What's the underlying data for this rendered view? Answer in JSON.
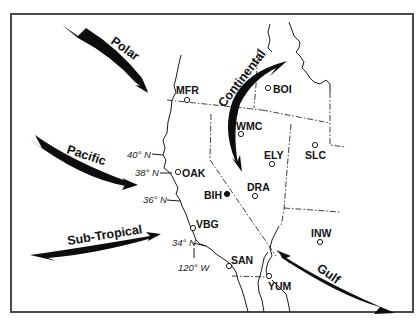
{
  "map": {
    "title": "Air mass source regions affecting the western United States",
    "colors": {
      "background": "#ffffff",
      "ink": "#111111",
      "frame": "#4a4a4a"
    },
    "air_masses": [
      {
        "id": "polar",
        "label": "Polar",
        "direction": "from northwest toward southeast"
      },
      {
        "id": "pacific",
        "label": "Pacific",
        "direction": "from west-northwest toward east"
      },
      {
        "id": "sub_tropical",
        "label": "Sub-Tropical",
        "direction": "from southwest toward northeast"
      },
      {
        "id": "continental",
        "label": "Continental",
        "direction": "from northeast curving south"
      },
      {
        "id": "gulf",
        "label": "Gulf",
        "direction": "from southeast toward northwest"
      }
    ],
    "stations": [
      {
        "code": "MFR",
        "marker": "open"
      },
      {
        "code": "BOI",
        "marker": "open"
      },
      {
        "code": "WMC",
        "marker": "open"
      },
      {
        "code": "ELY",
        "marker": "open"
      },
      {
        "code": "SLC",
        "marker": "open"
      },
      {
        "code": "OAK",
        "marker": "open"
      },
      {
        "code": "BIH",
        "marker": "filled"
      },
      {
        "code": "DRA",
        "marker": "open"
      },
      {
        "code": "VBG",
        "marker": "open"
      },
      {
        "code": "INW",
        "marker": "open"
      },
      {
        "code": "SAN",
        "marker": "open"
      },
      {
        "code": "YUM",
        "marker": "open"
      }
    ],
    "graticule": {
      "latitudes": [
        "40° N",
        "38° N",
        "36° N",
        "34° N"
      ],
      "longitudes": [
        "120° W"
      ]
    }
  }
}
